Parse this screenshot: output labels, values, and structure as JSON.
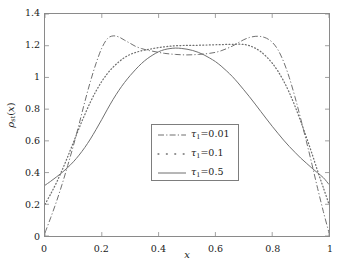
{
  "chart_data": {
    "type": "line",
    "title": "",
    "xlabel": "x",
    "ylabel": "ρ_st(x)",
    "ylabel_parts": {
      "symbol": "ρ",
      "sub": "st",
      "arg": "x"
    },
    "xlim": [
      0,
      1
    ],
    "ylim": [
      0,
      1.4
    ],
    "xticks": [
      "0",
      "0.2",
      "0.4",
      "0.6",
      "0.8",
      "1"
    ],
    "xtick_values": [
      0,
      0.2,
      0.4,
      0.6,
      0.8,
      1
    ],
    "yticks": [
      "0",
      "0.2",
      "0.4",
      "0.6",
      "0.8",
      "1",
      "1.2",
      "1.4"
    ],
    "ytick_values": [
      0,
      0.2,
      0.4,
      0.6,
      0.8,
      1.0,
      1.2,
      1.4
    ],
    "grid": false,
    "legend_position": "center",
    "line_color": "#6e6e6e",
    "frame_color": "#8a8a8a",
    "background": "#ffffff",
    "x": [
      0,
      0.02,
      0.04,
      0.06,
      0.08,
      0.1,
      0.12,
      0.14,
      0.16,
      0.18,
      0.2,
      0.22,
      0.24,
      0.26,
      0.28,
      0.3,
      0.32,
      0.34,
      0.36,
      0.38,
      0.4,
      0.42,
      0.44,
      0.46,
      0.48,
      0.5,
      0.52,
      0.54,
      0.56,
      0.58,
      0.6,
      0.62,
      0.64,
      0.66,
      0.68,
      0.7,
      0.72,
      0.74,
      0.76,
      0.78,
      0.8,
      0.82,
      0.84,
      0.86,
      0.88,
      0.9,
      0.92,
      0.94,
      0.96,
      0.98,
      1.0
    ],
    "series": [
      {
        "name": "τ_1=0.01",
        "label": "τ₁=0.01",
        "tau": 0.01,
        "style": "dashdot",
        "color": "#6e6e6e",
        "values": [
          0.02,
          0.115,
          0.215,
          0.325,
          0.445,
          0.57,
          0.705,
          0.845,
          0.975,
          1.09,
          1.185,
          1.245,
          1.262,
          1.255,
          1.235,
          1.215,
          1.195,
          1.182,
          1.172,
          1.165,
          1.158,
          1.152,
          1.148,
          1.145,
          1.143,
          1.142,
          1.143,
          1.145,
          1.148,
          1.152,
          1.158,
          1.168,
          1.182,
          1.198,
          1.218,
          1.238,
          1.252,
          1.259,
          1.258,
          1.247,
          1.222,
          1.175,
          1.1,
          1.0,
          0.878,
          0.742,
          0.6,
          0.452,
          0.3,
          0.155,
          0.02
        ]
      },
      {
        "name": "τ_1=0.1",
        "label": "τ₁=0.1",
        "tau": 0.1,
        "style": "dotted",
        "color": "#6e6e6e",
        "values": [
          0.2,
          0.265,
          0.335,
          0.415,
          0.5,
          0.59,
          0.68,
          0.765,
          0.845,
          0.915,
          0.975,
          1.025,
          1.065,
          1.098,
          1.125,
          1.145,
          1.158,
          1.168,
          1.175,
          1.182,
          1.188,
          1.193,
          1.197,
          1.2,
          1.201,
          1.202,
          1.202,
          1.203,
          1.204,
          1.205,
          1.206,
          1.207,
          1.208,
          1.209,
          1.21,
          1.208,
          1.2,
          1.185,
          1.162,
          1.13,
          1.09,
          1.04,
          0.978,
          0.905,
          0.82,
          0.725,
          0.625,
          0.52,
          0.41,
          0.305,
          0.2
        ]
      },
      {
        "name": "τ_1=0.5",
        "label": "τ₁=0.5",
        "tau": 0.5,
        "style": "solid",
        "color": "#6e6e6e",
        "values": [
          0.32,
          0.345,
          0.372,
          0.4,
          0.432,
          0.468,
          0.51,
          0.558,
          0.612,
          0.672,
          0.735,
          0.8,
          0.862,
          0.918,
          0.968,
          1.012,
          1.052,
          1.088,
          1.118,
          1.142,
          1.162,
          1.175,
          1.182,
          1.185,
          1.183,
          1.178,
          1.17,
          1.158,
          1.142,
          1.122,
          1.1,
          1.072,
          1.04,
          1.005,
          0.965,
          0.922,
          0.878,
          0.832,
          0.785,
          0.738,
          0.692,
          0.648,
          0.605,
          0.565,
          0.528,
          0.492,
          0.46,
          0.428,
          0.398,
          0.368,
          0.325
        ]
      }
    ]
  },
  "legend": {
    "items": [
      {
        "label": "τ₁=0.01",
        "symbol": "τ",
        "sub": "1",
        "value": "=0.01",
        "style": "dashdot"
      },
      {
        "label": "τ₁=0.1",
        "symbol": "τ",
        "sub": "1",
        "value": "=0.1",
        "style": "dotted"
      },
      {
        "label": "τ₁=0.5",
        "symbol": "τ",
        "sub": "1",
        "value": "=0.5",
        "style": "solid"
      }
    ]
  }
}
